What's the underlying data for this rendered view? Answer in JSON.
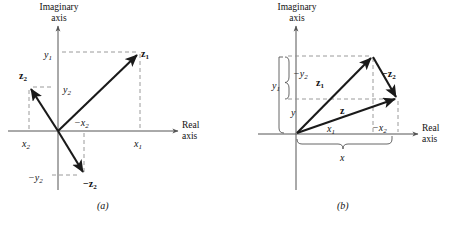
{
  "figure": {
    "background": "#ffffff",
    "line_color": "#1a1a1a",
    "dash_color": "#8a8a8a",
    "axis_color": "#555555"
  },
  "panels": [
    {
      "id": "a",
      "caption": "(a)",
      "axis_labels": {
        "imaginary_line1": "Imaginary",
        "imaginary_line2": "axis",
        "real_line1": "Real",
        "real_line2": "axis"
      },
      "vectors": [
        {
          "name": "z1",
          "label": "z",
          "sub": "1",
          "from": [
            0,
            0
          ],
          "to": [
            83,
            79
          ],
          "style": "bold-arrow"
        },
        {
          "name": "z2",
          "label": "z",
          "sub": "2",
          "from": [
            0,
            0
          ],
          "to": [
            -28,
            44
          ],
          "style": "bold-arrow"
        },
        {
          "name": "minus-z2",
          "label": "−z",
          "sub": "2",
          "from": [
            0,
            0
          ],
          "to": [
            28,
            -44
          ],
          "style": "bold-arrow"
        }
      ],
      "tick_labels": [
        {
          "name": "y1",
          "text": "y",
          "sub": "1"
        },
        {
          "name": "y2",
          "text": "y",
          "sub": "2"
        },
        {
          "name": "x1",
          "text": "x",
          "sub": "1"
        },
        {
          "name": "x2",
          "text": "x",
          "sub": "2"
        },
        {
          "name": "minus-x2",
          "text": "−x",
          "sub": "2"
        },
        {
          "name": "minus-y2",
          "text": "−y",
          "sub": "2"
        }
      ]
    },
    {
      "id": "b",
      "caption": "(b)",
      "axis_labels": {
        "imaginary_line1": "Imaginary",
        "imaginary_line2": "axis",
        "real_line1": "Real",
        "real_line2": "axis"
      },
      "vectors": [
        {
          "name": "z1",
          "label": "z",
          "sub": "1",
          "from": [
            0,
            0
          ],
          "to": [
            77,
            78
          ],
          "style": "bold-arrow"
        },
        {
          "name": "minus-z2",
          "label": "−z",
          "sub": "2",
          "from": [
            77,
            78
          ],
          "to": [
            101,
            35
          ],
          "style": "bold-arrow"
        },
        {
          "name": "z",
          "label": "z",
          "sub": "",
          "from": [
            0,
            0
          ],
          "to": [
            101,
            35
          ],
          "style": "bold-arrow"
        }
      ],
      "tick_labels": [
        {
          "name": "minus-y2",
          "text": "−y",
          "sub": "2"
        },
        {
          "name": "y1",
          "text": "y",
          "sub": "1"
        },
        {
          "name": "y",
          "text": "y",
          "sub": ""
        },
        {
          "name": "x1",
          "text": "x",
          "sub": "1"
        },
        {
          "name": "minus-x2",
          "text": "−x",
          "sub": "2"
        },
        {
          "name": "x",
          "text": "x",
          "sub": ""
        }
      ]
    }
  ]
}
